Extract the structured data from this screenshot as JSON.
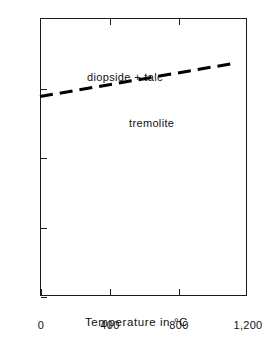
{
  "chart_data": {
    "type": "line",
    "title": "",
    "xlabel": "Temperature in °C",
    "ylabel": "Pressure in kilobars",
    "xlim": [
      0,
      1200
    ],
    "ylim": [
      0,
      40
    ],
    "grid": false,
    "legend": "none",
    "x_ticks": [
      {
        "value": 0,
        "label": "0"
      },
      {
        "value": 400,
        "label": "400"
      },
      {
        "value": 800,
        "label": "800"
      },
      {
        "value": 1200,
        "label": "1,200"
      }
    ],
    "y_ticks": [
      {
        "value": 0,
        "label": "0"
      },
      {
        "value": 10,
        "label": "10"
      },
      {
        "value": 20,
        "label": "20"
      },
      {
        "value": 30,
        "label": "30"
      },
      {
        "value": 40,
        "label": "40"
      }
    ],
    "x_ticks_top": [
      {
        "value": 400,
        "label": ""
      },
      {
        "value": 800,
        "label": ""
      }
    ],
    "series": [
      {
        "name": "tremolite = diopside + talc reaction boundary",
        "style": "dashed",
        "color": "#000000",
        "x": [
          0,
          1130
        ],
        "y": [
          28.7,
          33.5
        ]
      }
    ],
    "annotations": [
      {
        "text": "diopside + talc",
        "x": 40,
        "y": 35.6
      },
      {
        "text": "tremolite",
        "x": 330,
        "y": 28.9
      }
    ]
  }
}
